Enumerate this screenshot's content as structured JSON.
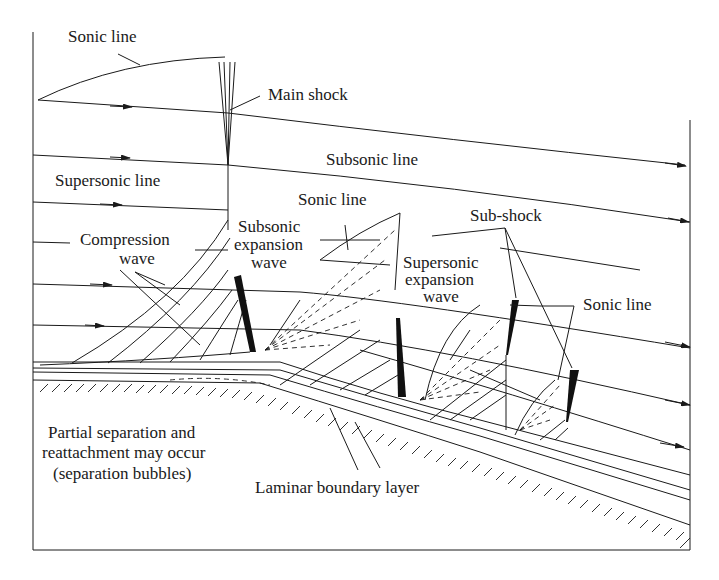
{
  "figure": {
    "labels": {
      "sonic_line_top": "Sonic line",
      "main_shock": "Main shock",
      "subsonic_line": "Subsonic line",
      "supersonic_line": "Supersonic line",
      "sonic_line_mid": "Sonic line",
      "sub_shock": "Sub-shock",
      "compression_wave_1": "Compression",
      "compression_wave_2": "wave",
      "subsonic_expansion_1": "Subsonic",
      "subsonic_expansion_2": "expansion",
      "subsonic_expansion_3": "wave",
      "supersonic_expansion_1": "Supersonic",
      "supersonic_expansion_2": "expansion",
      "supersonic_expansion_3": "wave",
      "sonic_line_right": "Sonic line",
      "separation_1": "Partial separation and",
      "separation_2": "reattachment may occur",
      "separation_3": "(separation bubbles)",
      "laminar_bl": "Laminar boundary layer"
    },
    "colors": {
      "ink": "#1a1a1a",
      "background": "#ffffff"
    }
  }
}
